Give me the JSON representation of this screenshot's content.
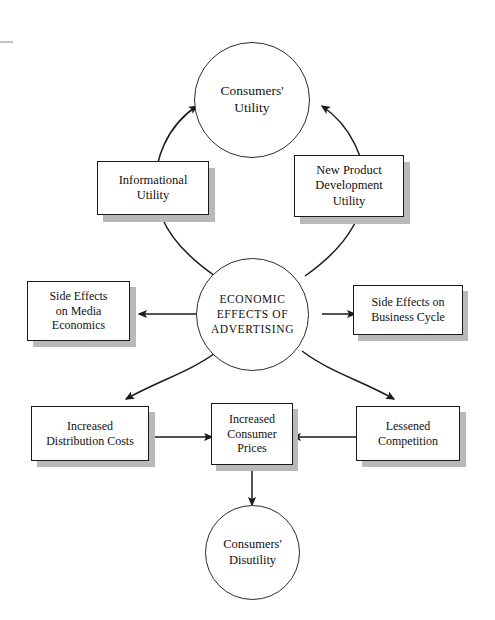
{
  "diagram": {
    "title": "Economic Effects of Advertising",
    "type": "concept-flow-diagram",
    "background_color": "#ffffff",
    "line_color": "#1a1a1a",
    "shadow_color": "#b9b9b9",
    "nodes": {
      "consumers_utility": {
        "label": "Consumers'\nUtility",
        "shape": "circle"
      },
      "informational_utility": {
        "label": "Informational\nUtility",
        "shape": "box"
      },
      "new_product_development_utility": {
        "label": "New Product\nDevelopment\nUtility",
        "shape": "box"
      },
      "economic_effects": {
        "label": "ECONOMIC\nEFFECTS OF\nADVERTISING",
        "shape": "circle"
      },
      "side_effects_media": {
        "label": "Side Effects\non Media\nEconomics",
        "shape": "box"
      },
      "side_effects_business_cycle": {
        "label": "Side Effects on\nBusiness Cycle",
        "shape": "box"
      },
      "increased_distribution_costs": {
        "label": "Increased\nDistribution Costs",
        "shape": "box"
      },
      "increased_consumer_prices": {
        "label": "Increased\nConsumer\nPrices",
        "shape": "box"
      },
      "lessened_competition": {
        "label": "Lessened\nCompetition",
        "shape": "box"
      },
      "consumers_disutility": {
        "label": "Consumers'\nDisutility",
        "shape": "circle"
      }
    },
    "edges": [
      {
        "from": "economic_effects",
        "to": "consumers_utility",
        "via": "informational_utility",
        "style": "curved-arrow"
      },
      {
        "from": "economic_effects",
        "to": "consumers_utility",
        "via": "new_product_development_utility",
        "style": "curved-arrow"
      },
      {
        "from": "economic_effects",
        "to": "side_effects_media",
        "style": "straight-arrow"
      },
      {
        "from": "economic_effects",
        "to": "side_effects_business_cycle",
        "style": "straight-arrow"
      },
      {
        "from": "economic_effects",
        "to": "increased_distribution_costs",
        "style": "curved-arrow"
      },
      {
        "from": "economic_effects",
        "to": "lessened_competition",
        "style": "curved-arrow"
      },
      {
        "from": "increased_distribution_costs",
        "to": "increased_consumer_prices",
        "style": "straight-arrow"
      },
      {
        "from": "lessened_competition",
        "to": "increased_consumer_prices",
        "style": "straight-arrow"
      },
      {
        "from": "increased_consumer_prices",
        "to": "consumers_disutility",
        "style": "straight-arrow"
      }
    ]
  }
}
